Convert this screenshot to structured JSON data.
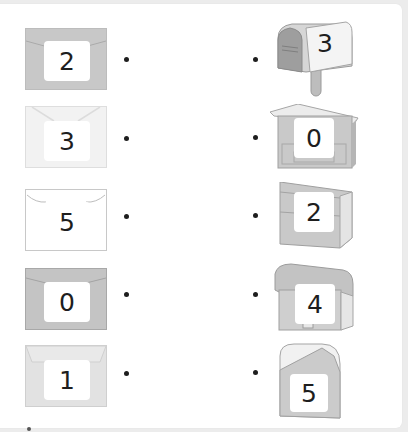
{
  "worksheet": {
    "instruction": "Match each envelope to the mailbox with the same number",
    "envelopes": [
      {
        "number": "2",
        "color": "#c8c8c8",
        "style": "dark-gray"
      },
      {
        "number": "3",
        "color": "#f2f2f2",
        "style": "very-light"
      },
      {
        "number": "5",
        "color": "#ffffff",
        "style": "white"
      },
      {
        "number": "0",
        "color": "#c4c4c4",
        "style": "dark-gray"
      },
      {
        "number": "1",
        "color": "#e2e2e2",
        "style": "light-gray"
      }
    ],
    "mailboxes": [
      {
        "number": "3",
        "type": "rural-mailbox-on-post"
      },
      {
        "number": "0",
        "type": "wall-box-with-roof"
      },
      {
        "number": "2",
        "type": "wall-box-slanted"
      },
      {
        "number": "4",
        "type": "wall-box-rounded-top"
      },
      {
        "number": "5",
        "type": "standing-box-rounded-top"
      }
    ]
  },
  "colors": {
    "background": "#ececec",
    "panel": "#ffffff",
    "box_fill": "#c9c9c9",
    "box_dark": "#a9a9a9",
    "box_light": "#e6e6e6",
    "digit": "#1e1e1e"
  }
}
